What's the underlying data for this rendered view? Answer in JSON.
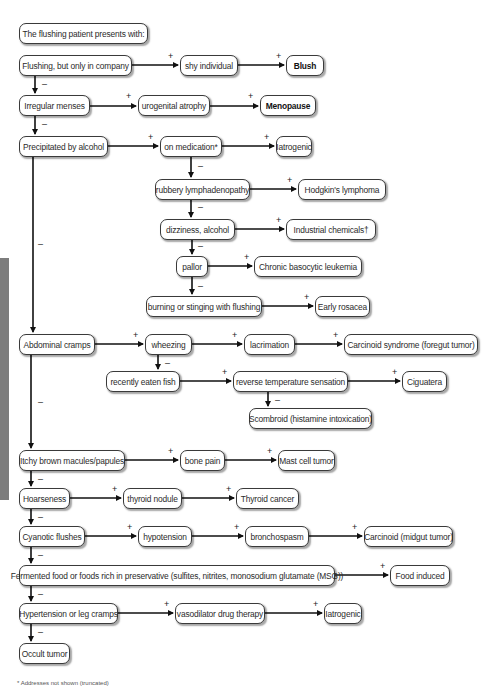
{
  "diagram": {
    "title": "The flushing patient presents with:",
    "nodes": {
      "flushing_company": "Flushing, but only in company",
      "shy_individual": "shy individual",
      "blush": "Blush",
      "irregular_menses": "Irregular menses",
      "urogenital_atrophy": "urogenital atrophy",
      "menopause": "Menopause",
      "precipitated_alcohol": "Precipitated by alcohol",
      "on_medication": "on medication*",
      "iatrogenic_1": "Iatrogenic",
      "rubbery_lymph": "rubbery lymphadenopathy",
      "hodgkins": "Hodgkin's lymphoma",
      "dizziness_alcohol": "dizziness, alcohol",
      "industrial_chemicals": "Industrial chemicals†",
      "pallor": "pallor",
      "chronic_basocytic": "Chronic basocytic leukemia",
      "burning_stinging": "burning or stinging with flushing",
      "early_rosacea": "Early rosacea",
      "abdominal_cramps": "Abdominal cramps",
      "wheezing": "wheezing",
      "lacrimation": "lacrimation",
      "carcinoid_foregut": "Carcinoid syndrome (foregut tumor)",
      "recently_fish": "recently eaten fish",
      "reverse_temp": "reverse temperature sensation",
      "ciguatera": "Ciguatera",
      "scombroid": "Scombroid (histamine intoxication)",
      "itchy_macules": "Itchy brown macules/papules",
      "bone_pain": "bone pain",
      "mast_cell": "Mast cell tumor",
      "hoarseness": "Hoarseness",
      "thyroid_nodule": "thyroid nodule",
      "thyroid_cancer": "Thyroid cancer",
      "cyanotic_flushes": "Cyanotic flushes",
      "hypotension": "hypotension",
      "bronchospasm": "bronchospasm",
      "carcinoid_midgut": "Carcinoid (midgut tumor)",
      "fermented_food": "Fermented food or foods rich in preservative (sulfites, nitrites, monosodium glutamate (MSG))",
      "food_induced": "Food induced",
      "hypertension_leg": "Hypertension or leg cramps",
      "vasodilator": "vasodilator drug therapy",
      "iatrogenic_2": "Iatrogenic",
      "occult_tumor": "Occult tumor"
    },
    "signs": {
      "yes": "+",
      "no": "–"
    },
    "footnote": "* Addresses not shown (truncated)"
  },
  "colors": {
    "line": "#111111",
    "border": "#3a3a3a",
    "sidebar_tab": "#7d7d7d"
  }
}
